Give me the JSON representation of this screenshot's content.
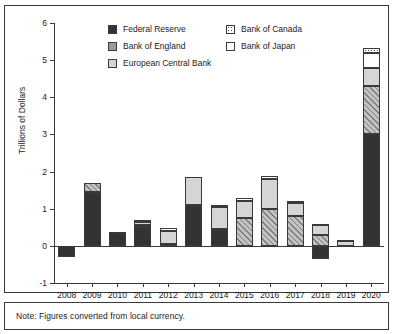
{
  "note": {
    "text": "Note: Figures converted from local currency."
  },
  "legend": {
    "position": "top-center",
    "items": [
      {
        "label": "Federal Reserve",
        "key": "fed",
        "swatch": "solid-black"
      },
      {
        "label": "Bank of Canada",
        "key": "boc",
        "swatch": "dotted"
      },
      {
        "label": "Bank of England",
        "key": "boe",
        "swatch": "diagonal-hatch-gray"
      },
      {
        "label": "Bank of Japan",
        "key": "boj",
        "swatch": "white"
      },
      {
        "label": "European Central Bank",
        "key": "ecb",
        "swatch": "light-gray"
      }
    ]
  },
  "chart_data": {
    "type": "bar",
    "stacked": true,
    "title": "",
    "xlabel": "",
    "ylabel": "Trillions of Dollars",
    "ylim": [
      -1,
      6
    ],
    "yticks": [
      -1,
      0,
      1,
      2,
      3,
      4,
      5,
      6
    ],
    "ytick_labels": [
      "-1",
      "0",
      "1",
      "2",
      "3",
      "4",
      "5",
      "6"
    ],
    "grid": false,
    "categories": [
      "2008",
      "2009",
      "2010",
      "2011",
      "2012",
      "2013",
      "2014",
      "2015",
      "2016",
      "2017",
      "2018",
      "2019",
      "2020"
    ],
    "series": [
      {
        "name": "Federal Reserve",
        "key": "fed",
        "values": [
          -0.3,
          1.45,
          0.38,
          0.5,
          0.05,
          1.1,
          0.45,
          0.0,
          0.0,
          0.0,
          -0.35,
          0.0,
          3.0
        ]
      },
      {
        "name": "Bank of England",
        "key": "boe",
        "values": [
          0.0,
          0.25,
          0.0,
          0.05,
          0.0,
          0.0,
          0.0,
          0.75,
          1.0,
          0.8,
          0.3,
          0.0,
          1.3
        ]
      },
      {
        "name": "European Central Bank",
        "key": "ecb",
        "values": [
          0.0,
          0.0,
          0.0,
          0.1,
          0.35,
          0.75,
          0.6,
          0.45,
          0.8,
          0.35,
          0.25,
          0.12,
          0.5
        ]
      },
      {
        "name": "Bank of Japan",
        "key": "boj",
        "values": [
          0.0,
          0.0,
          0.0,
          0.05,
          0.08,
          0.0,
          0.0,
          0.1,
          0.08,
          0.05,
          0.05,
          0.05,
          0.4
        ]
      },
      {
        "name": "Bank of Canada",
        "key": "boc",
        "values": [
          0.0,
          0.0,
          0.0,
          0.0,
          0.0,
          0.0,
          0.05,
          0.0,
          0.0,
          0.0,
          0.0,
          0.0,
          0.12
        ]
      }
    ]
  }
}
